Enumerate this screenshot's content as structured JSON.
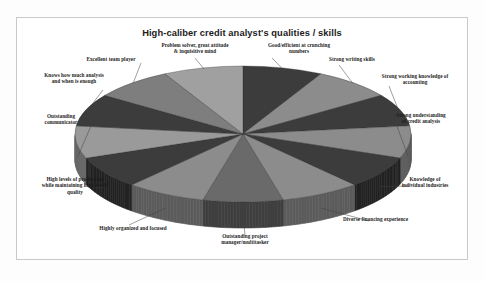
{
  "chart_data": {
    "type": "pie",
    "title": "High-caliber credit analyst's qualities / skills",
    "subtitle": "",
    "xlabel": "",
    "ylabel": "",
    "legend_position": "none",
    "grid": false,
    "three_d": true,
    "labels_outside": true,
    "equal_slices": true,
    "slice_count": 13,
    "categories": [
      "Good/efficient at crunching numbers",
      "Strong writing skills",
      "Strong working knowledge of accounting",
      "Strong understanding of credit analysis",
      "Knowledge of individual industries",
      "Diverse financing experience",
      "Outstanding project manager/multitasker",
      "Highly organized and focused",
      "High levels of production while maintaining high credit quality",
      "Outstanding communicator",
      "Knows how much analysis and when is enough",
      "Excellent team player",
      "Problem solver, great attitude & inquisitive mind"
    ],
    "values": [
      7.69,
      7.69,
      7.69,
      7.69,
      7.69,
      7.69,
      7.69,
      7.69,
      7.69,
      7.69,
      7.69,
      7.69,
      7.69
    ],
    "colors": [
      "#3c3c3c",
      "#8c8c8c",
      "#3c3c3c",
      "#8c8c8c",
      "#3c3c3c",
      "#8c8c8c",
      "#6a6a6a",
      "#8c8c8c",
      "#3c3c3c",
      "#9a9a9a",
      "#3c3c3c",
      "#7e7e7e",
      "#a0a0a0"
    ],
    "side_colors": [
      "#232323",
      "#5c5c5c",
      "#232323",
      "#5c5c5c",
      "#232323",
      "#5c5c5c",
      "#3f3f3f",
      "#5c5c5c",
      "#232323",
      "#666666",
      "#232323",
      "#4e4e4e",
      "#6e6e6e"
    ]
  },
  "labels": {
    "problem_solver": "Problem solver, great attitude\n& inquisitive mind",
    "good_efficient": "Good/efficient at crunching\nnumbers",
    "strong_writing": "Strong writing skills",
    "strong_accounting": "Strong working knowledge of\naccounting",
    "strong_credit": "Strong understanding\nof credit analysis",
    "knowledge_industries": "Knowledge of\nindividual industries",
    "diverse_financing": "Diverse financing experience",
    "outstanding_project": "Outstanding project\nmanager/multitasker",
    "highly_organized": "Highly organized and focused",
    "high_levels": "High levels of production\nwhile maintaining high credit\nquality",
    "outstanding_comm": "Outstanding\ncommunicator",
    "knows_analysis": "Knows how much analysis\nand when is enough",
    "excellent_team": "Excellent team player"
  },
  "colors": {
    "frame_border": "#c9c9c9",
    "background": "#ffffff",
    "title_text": "#1b1b1b",
    "label_text": "#1c1c1c",
    "leader_line": "#404040"
  }
}
